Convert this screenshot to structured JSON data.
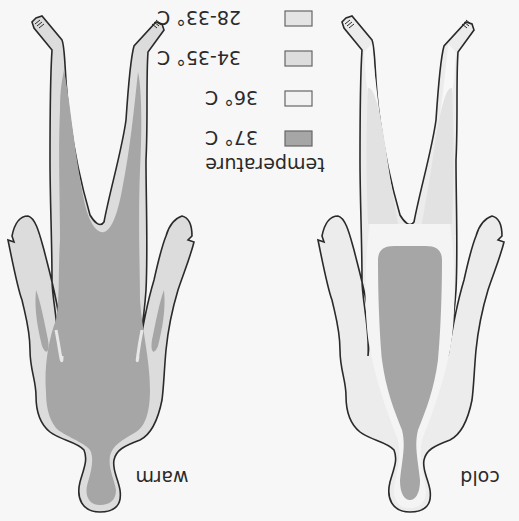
{
  "diagram": {
    "orientation": "rotated-180",
    "figures": [
      {
        "id": "warm",
        "label": "warm"
      },
      {
        "id": "cold",
        "label": "cold"
      }
    ],
    "legend": {
      "title": "temperature",
      "items": [
        {
          "label": "37° C",
          "color": "#a6a6a6"
        },
        {
          "label": "36° C",
          "color": "#f2f2f2"
        },
        {
          "label": "34-35° C",
          "color": "#dddddd"
        },
        {
          "label": "28-33° C",
          "color": "#e4e4e4"
        }
      ]
    },
    "colors": {
      "background": "#f7f7f7",
      "outline": "#2a2a2a",
      "core_37": "#a6a6a6",
      "band_36": "#f2f2f2",
      "band_34_35": "#dcdcdc",
      "band_28_33": "#e6e6e6"
    }
  }
}
